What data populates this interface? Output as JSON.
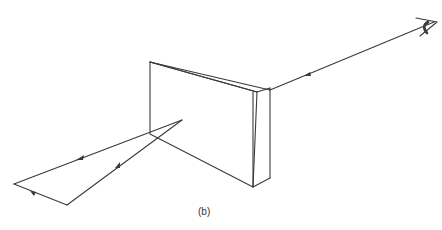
{
  "figure": {
    "caption": "(b)",
    "elements": [
      {
        "name": "glass-block",
        "type": "rectangular prism / slab"
      },
      {
        "name": "incident-ray-path",
        "description": "light path entering block, reflecting toward lower-left"
      },
      {
        "name": "eye",
        "description": "observer eye at upper right"
      },
      {
        "name": "observer-ray",
        "description": "line of sight from eye to block with arrowhead"
      }
    ]
  },
  "colors": {
    "stroke": "#3a3a3a",
    "background": "#ffffff"
  }
}
